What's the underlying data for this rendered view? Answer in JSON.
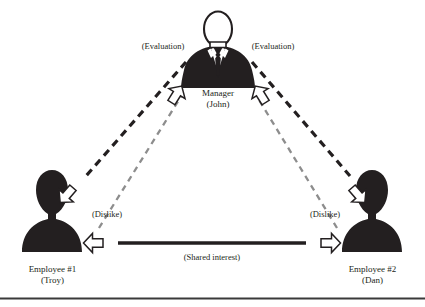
{
  "diagram": {
    "type": "relationship-triad-diagram",
    "background_color": "#ffffff",
    "ink_color": "#231f20",
    "accent_gray": "#8d8d8d",
    "nodes": [
      {
        "id": "manager",
        "icon": "person-suit-icon",
        "label_line1": "Manager",
        "label_line2": "(John)",
        "position": "top-center"
      },
      {
        "id": "employee-1",
        "icon": "person-silhouette-icon",
        "label_line1": "Employee #1",
        "label_line2": "(Troy)",
        "position": "bottom-left"
      },
      {
        "id": "employee-2",
        "icon": "person-silhouette-icon",
        "label_line1": "Employee #2",
        "label_line2": "(Dan)",
        "position": "bottom-right"
      }
    ],
    "edges": [
      {
        "id": "evaluation-left",
        "label": "(Evaluation)",
        "style": "dashed",
        "color": "#231f20",
        "width": 3,
        "from": "manager",
        "to": "employee-1",
        "arrow": "single-open-block"
      },
      {
        "id": "evaluation-right",
        "label": "(Evaluation)",
        "style": "dashed",
        "color": "#231f20",
        "width": 3,
        "from": "manager",
        "to": "employee-2",
        "arrow": "single-open-block"
      },
      {
        "id": "dislike-left",
        "label": "(Dislike)",
        "style": "dashed",
        "color": "#8d8d8d",
        "width": 2,
        "from": "employee-1",
        "to": "manager",
        "arrow": "single-open-block"
      },
      {
        "id": "dislike-right",
        "label": "(Dislike)",
        "style": "dashed",
        "color": "#8d8d8d",
        "width": 2,
        "from": "employee-2",
        "to": "manager",
        "arrow": "single-open-block"
      },
      {
        "id": "shared-interest",
        "label": "(Shared interest)",
        "style": "solid",
        "color": "#231f20",
        "width": 3,
        "from": "employee-1",
        "to": "employee-2",
        "arrow": "double-open-block"
      }
    ],
    "footer_rule": true
  }
}
